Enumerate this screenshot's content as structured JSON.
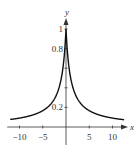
{
  "chart_data": {
    "type": "line",
    "title": "",
    "xlabel": "x",
    "ylabel": "y",
    "function": "y = 1/(1+|x|)",
    "xlim": [
      -12,
      12.5
    ],
    "ylim": [
      0,
      1.05
    ],
    "grid": false,
    "x_ticks": [
      -10,
      -5,
      5,
      10
    ],
    "x_tick_labels": [
      "−10",
      "−5",
      "5",
      "10"
    ],
    "y_ticks": [
      0.2,
      0.4,
      0.6,
      0.8,
      1
    ],
    "y_tick_labels": [
      "0.2",
      "0.8",
      "1"
    ],
    "series": [
      {
        "name": "curve",
        "x": [
          -12,
          -10,
          -8,
          -6,
          -5,
          -4,
          -3,
          -2,
          -1,
          -0.5,
          0,
          0.5,
          1,
          2,
          3,
          4,
          5,
          6,
          8,
          10,
          12
        ],
        "y": [
          0.077,
          0.091,
          0.111,
          0.143,
          0.167,
          0.2,
          0.25,
          0.333,
          0.5,
          0.667,
          1.0,
          0.667,
          0.5,
          0.333,
          0.25,
          0.2,
          0.167,
          0.143,
          0.111,
          0.091,
          0.077
        ]
      }
    ],
    "colors": {
      "curve": "#111111",
      "axes": "#333333"
    }
  }
}
